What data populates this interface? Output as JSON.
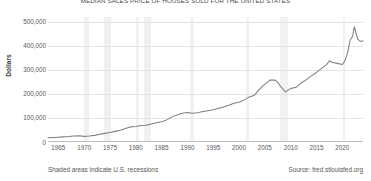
{
  "chart_data": {
    "type": "line",
    "title": "MEDIAN SALES PRICE OF HOUSES SOLD FOR THE UNITED STATES",
    "xlabel": "",
    "ylabel": "Dollars",
    "xlim": [
      1963,
      2024
    ],
    "ylim": [
      0,
      520000
    ],
    "grid": true,
    "legend": "none",
    "y_ticks": [
      0,
      100000,
      200000,
      300000,
      400000,
      500000
    ],
    "y_tick_labels": [
      "0",
      "100,000",
      "200,000",
      "300,000",
      "400,000",
      "500,000"
    ],
    "x_ticks": [
      1965,
      1970,
      1975,
      1980,
      1985,
      1990,
      1995,
      2000,
      2005,
      2010,
      2015,
      2020
    ],
    "x_tick_labels": [
      "1965",
      "1970",
      "1975",
      "1980",
      "1985",
      "1990",
      "1995",
      "2000",
      "2005",
      "2010",
      "2015",
      "2020"
    ],
    "line_color": "#7f7f7f",
    "recession_color": "#f1f1f1",
    "series": [
      {
        "name": "Median Sales Price of Houses Sold for the United States",
        "x": [
          1963.0,
          1964.0,
          1965.0,
          1966.0,
          1967.0,
          1968.0,
          1969.0,
          1970.0,
          1971.0,
          1972.0,
          1973.0,
          1974.0,
          1975.0,
          1976.0,
          1977.0,
          1978.0,
          1979.0,
          1980.0,
          1981.0,
          1982.0,
          1983.0,
          1984.0,
          1985.0,
          1986.0,
          1987.0,
          1988.0,
          1989.0,
          1990.0,
          1991.0,
          1992.0,
          1993.0,
          1994.0,
          1995.0,
          1996.0,
          1997.0,
          1998.0,
          1999.0,
          2000.0,
          2001.0,
          2002.0,
          2003.0,
          2004.0,
          2005.0,
          2006.0,
          2007.0,
          2007.5,
          2008.0,
          2009.0,
          2010.0,
          2011.0,
          2012.0,
          2013.0,
          2014.0,
          2015.0,
          2016.0,
          2017.0,
          2017.5,
          2018.0,
          2019.0,
          2020.0,
          2020.5,
          2021.0,
          2021.5,
          2022.0,
          2022.3,
          2022.8,
          2023.0,
          2023.5,
          2024.0
        ],
        "y": [
          17800,
          18900,
          20000,
          21400,
          22700,
          24700,
          25600,
          23400,
          25200,
          27600,
          32500,
          35900,
          39300,
          44200,
          48800,
          55700,
          62900,
          64600,
          68900,
          69300,
          75300,
          79900,
          84300,
          92000,
          104500,
          112500,
          120000,
          122900,
          120000,
          121500,
          126500,
          130000,
          133900,
          140000,
          146000,
          152500,
          161000,
          165300,
          175200,
          187600,
          195000,
          221000,
          240900,
          257400,
          257400,
          247900,
          232100,
          208400,
          222900,
          227200,
          245200,
          258400,
          275200,
          289300,
          306000,
          323100,
          337900,
          331800,
          327100,
          322600,
          337500,
          369800,
          423600,
          440000,
          479500,
          442000,
          426800,
          418500,
          420800
        ]
      }
    ],
    "recessions": [
      {
        "start": 1969.92,
        "end": 1970.92
      },
      {
        "start": 1973.92,
        "end": 1975.25
      },
      {
        "start": 1980.08,
        "end": 1980.58
      },
      {
        "start": 1981.58,
        "end": 1982.92
      },
      {
        "start": 1990.58,
        "end": 1991.25
      },
      {
        "start": 2001.25,
        "end": 2001.92
      },
      {
        "start": 2007.92,
        "end": 2009.5
      },
      {
        "start": 2020.17,
        "end": 2020.42
      }
    ]
  },
  "footer": {
    "note": "Shaded areas indicate U.S. recessions",
    "source": "Source: fred.stlouisfed.org"
  }
}
